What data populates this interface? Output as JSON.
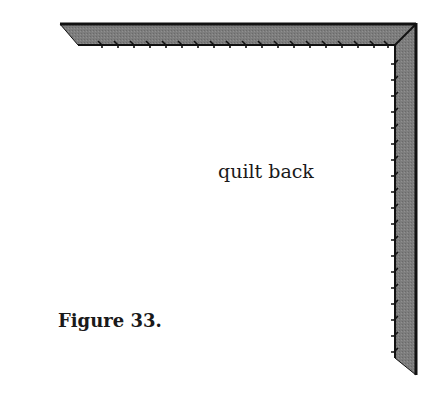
{
  "diagram": {
    "type": "quilt binding corner illustration",
    "labels": {
      "center": "quilt back",
      "caption": "Figure 33."
    },
    "binding": {
      "fill_color": "#7a7a7a",
      "edge_color": "#111111",
      "orientation": "top and right edges, mitered corner at top-right",
      "stitch_marks": "hand stitches along inner edge"
    }
  }
}
